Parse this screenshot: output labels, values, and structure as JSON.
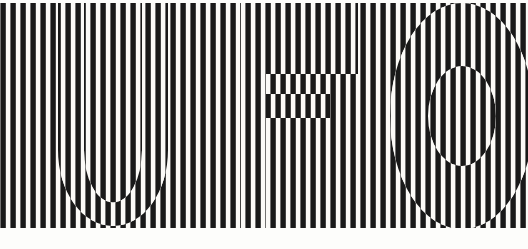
{
  "artwork": {
    "title": "UFO",
    "alt_text": "Op-art poster: the word UFO formed by inverting a field of vertical black and white stripes",
    "style": "op-art striped lettering",
    "word": "UFO",
    "letters": [
      "U",
      "F",
      "O"
    ],
    "canvas": {
      "width": 528,
      "height": 249,
      "background_color": "#fdfdfb",
      "paper_tone": "#f7f6f2"
    },
    "stripes": {
      "ink_color": "#111111",
      "paper_color": "#fbfaf7",
      "orientation": "vertical",
      "period_px": 10,
      "bar_width_px": 5.4,
      "count": 53,
      "field_top_px": 3,
      "field_bottom_px": 228,
      "field_left_px": 0,
      "field_right_px": 528,
      "inversion_note": "stripe phase inverts inside letterforms"
    },
    "glyph_geometry": {
      "U": {
        "outer_left": 58,
        "outer_right": 168,
        "top": 3,
        "bottom": 226,
        "stem_width": 26,
        "bowl_radius": 55
      },
      "F": {
        "stem_left": 240,
        "stem_right": 266,
        "top": 3,
        "bottom": 228,
        "arm_top_right": 358,
        "arm_top_bottom": 74,
        "bar_mid_top": 94,
        "bar_mid_bottom": 118,
        "bar_mid_right": 330
      },
      "O": {
        "center_x": 462,
        "center_y": 116,
        "outer_rx": 72,
        "outer_ry": 113,
        "inner_rx": 34,
        "inner_ry": 50,
        "cropped_right_edge": true
      }
    }
  },
  "toolbar": {
    "zoom_label": "100%"
  }
}
